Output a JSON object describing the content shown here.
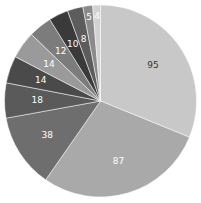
{
  "chart_data": {
    "type": "pie",
    "title": "",
    "start_angle": "12 o'clock",
    "direction": "clockwise",
    "legend": "none",
    "values": [
      95,
      87,
      38,
      18,
      14,
      14,
      12,
      10,
      8,
      5,
      4
    ],
    "labels": [
      "95",
      "87",
      "38",
      "18",
      "14",
      "14",
      "12",
      "10",
      "8",
      "5",
      "4"
    ],
    "colors": [
      "#c8c8c8",
      "#a9a9a9",
      "#6e6e6e",
      "#5a5a5a",
      "#4a4a4a",
      "#9a9a9a",
      "#7c7c7c",
      "#3a3a3a",
      "#5c5c5c",
      "#8a8a8a",
      "#d2d2d2"
    ],
    "label_dark": [
      true,
      false,
      false,
      false,
      false,
      false,
      false,
      false,
      false,
      false,
      false
    ]
  }
}
